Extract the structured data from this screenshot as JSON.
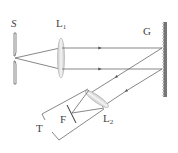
{
  "diagram": {
    "type": "grating spectrometer optical setup",
    "labels": {
      "slit": "S",
      "lens1": "L",
      "lens1_sub": "1",
      "grating": "G",
      "lens2": "L",
      "lens2_sub": "2",
      "focal_plane": "F",
      "telescope": "T"
    },
    "components": [
      {
        "id": "S",
        "name": "slit"
      },
      {
        "id": "L1",
        "name": "collimating lens"
      },
      {
        "id": "G",
        "name": "reflection grating"
      },
      {
        "id": "L2",
        "name": "telescope objective lens"
      },
      {
        "id": "F",
        "name": "focal plane"
      },
      {
        "id": "T",
        "name": "telescope"
      }
    ],
    "colors": {
      "line": "#555555",
      "lens_fill": "#e6e6e6",
      "lens_stroke": "#999999",
      "background": "#ffffff"
    }
  }
}
